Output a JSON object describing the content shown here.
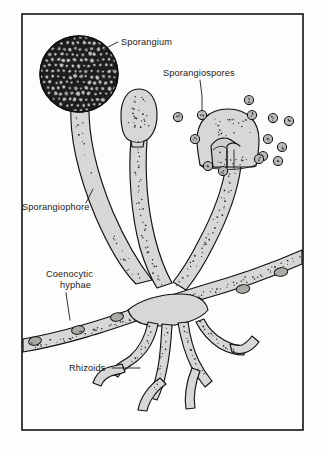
{
  "figure": {
    "background_color": "#fdfdfc",
    "frame": {
      "x": 22,
      "y": 14,
      "width": 281,
      "height": 416,
      "stroke_color": "#121212"
    }
  },
  "palette": {
    "outline": "#111111",
    "hyphae_fill": "#d7d7d5",
    "sporangium_dark": "#1d1d1d",
    "spore_fill": "#b9b9b7",
    "nucleus_fill": "#a9a9a6",
    "stipple": "#2a2a2a",
    "label_text": "#1a1a1a",
    "page_background": "#fdfdfc"
  },
  "labels": [
    {
      "id": "sporangium",
      "text": "Sporangium",
      "text_x": 121,
      "text_y": 45,
      "anchor": "start",
      "leader": "M 118 42 L 104 49 L 97 53",
      "description": "Mature spore case, dark sphere filled with spores"
    },
    {
      "id": "sporangiospores",
      "text": "Sporangiospores",
      "text_x": 163,
      "text_y": 76,
      "anchor": "start",
      "leader": "M 200 80 L 202 96 L 202 110",
      "description": "Released asexual spores"
    },
    {
      "id": "sporangiophore",
      "text": "Sporangiophore",
      "text_x": 22,
      "text_y": 210,
      "anchor": "start",
      "leader": "M 86 203 L 93 189",
      "description": "Aerial stalk bearing the sporangium"
    },
    {
      "id": "coenocytic-hyphae",
      "text_lines": [
        "Coenocytic",
        "hyphae"
      ],
      "text_x": 46,
      "text_y": 277,
      "line_height": 11,
      "anchor": "start",
      "leader": "M 66 293 L 70 320",
      "description": "Multinucleate hyphae lacking septa"
    },
    {
      "id": "rhizoids",
      "text": "Rhizoids",
      "text_x": 69,
      "text_y": 371,
      "anchor": "start",
      "leader": "M 112 368 L 140 368",
      "description": "Root-like anchoring and absorbing filaments"
    }
  ],
  "structures": {
    "mature_sporangium": {
      "name": "mature-sporangium",
      "center_x": 79,
      "center_y": 74,
      "radius_x": 39,
      "radius_y": 38,
      "fill": "#1d1d1d",
      "cell_count": 150
    },
    "immature_sporangium": {
      "name": "immature-sporangium",
      "center_x": 139,
      "center_y": 115,
      "radius_x": 17,
      "radius_y": 26
    },
    "ruptured_sporangium": {
      "name": "ruptured-sporangium",
      "center_x": 228,
      "center_y": 138,
      "radius_x": 30,
      "radius_y": 29
    },
    "columella": {
      "name": "columella",
      "description": "Dome-shaped sterile tissue inside the ruptured sporangium"
    },
    "stolon": {
      "name": "coenocytic-hypha-stolon",
      "description": "Horizontal multinucleate hypha running across the figure",
      "nuclei_count": 6
    },
    "rhizoids": {
      "name": "rhizoid-cluster",
      "branch_count": 8
    }
  },
  "spores": [
    {
      "x": 178,
      "y": 117,
      "r": 4.6
    },
    {
      "x": 195,
      "y": 139,
      "r": 4.6
    },
    {
      "x": 202,
      "y": 115,
      "r": 4.6
    },
    {
      "x": 249,
      "y": 100,
      "r": 4.6
    },
    {
      "x": 252,
      "y": 115,
      "r": 4.6
    },
    {
      "x": 263,
      "y": 156,
      "r": 4.6
    },
    {
      "x": 273,
      "y": 118,
      "r": 4.6
    },
    {
      "x": 268,
      "y": 139,
      "r": 4.6
    },
    {
      "x": 282,
      "y": 147,
      "r": 4.6
    },
    {
      "x": 289,
      "y": 121,
      "r": 4.6
    },
    {
      "x": 278,
      "y": 161,
      "r": 4.6
    },
    {
      "x": 259,
      "y": 159,
      "r": 4.6
    },
    {
      "x": 223,
      "y": 171,
      "r": 4.6
    },
    {
      "x": 208,
      "y": 166,
      "r": 4.6
    }
  ],
  "nuclei": [
    {
      "x": 35,
      "y": 341,
      "rx": 6.5,
      "ry": 4.2,
      "rot": -12
    },
    {
      "x": 78,
      "y": 330,
      "rx": 6.5,
      "ry": 4.2,
      "rot": -12
    },
    {
      "x": 117,
      "y": 317,
      "rx": 6.5,
      "ry": 4.2,
      "rot": -10
    },
    {
      "x": 196,
      "y": 302,
      "rx": 7.0,
      "ry": 4.4,
      "rot": -8
    },
    {
      "x": 243,
      "y": 289,
      "rx": 6.8,
      "ry": 4.3,
      "rot": -8
    },
    {
      "x": 281,
      "y": 272,
      "rx": 6.8,
      "ry": 4.3,
      "rot": -8
    }
  ]
}
